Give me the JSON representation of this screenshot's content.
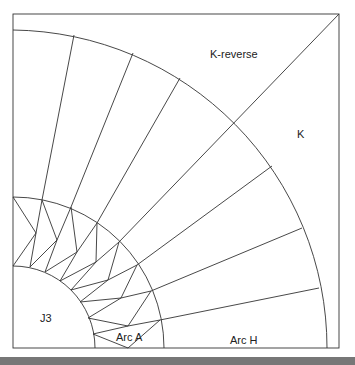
{
  "diagram": {
    "labels": {
      "k_reverse": "K-reverse",
      "k": "K",
      "j3": "J3",
      "arc_a": "Arc A",
      "arc_h": "Arc H"
    },
    "colors": {
      "stroke": "#333333",
      "background": "#ffffff",
      "bottom_bar": "#777777"
    }
  }
}
